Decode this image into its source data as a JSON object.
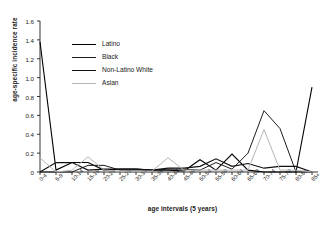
{
  "chart_data": {
    "type": "line",
    "title": "",
    "xlabel": "age intervals (5 years)",
    "ylabel": "age-specific incidence rate",
    "ylim": [
      0,
      1.6
    ],
    "ytick_step": 0.2,
    "yticks": [
      "0",
      "0.2",
      "0.4",
      "0.6",
      "0.8",
      "1.0",
      "1.2",
      "1.4",
      "1.6"
    ],
    "grid": false,
    "legend_position": "upper-center-left",
    "categories": [
      "0-4",
      "5-9",
      "10-14",
      "15-19",
      "20-24",
      "25-29",
      "30-34",
      "35-39",
      "40-44",
      "45-49",
      "50-54",
      "55-59",
      "60-64",
      "65-69",
      "70-74",
      "75-79",
      "80-84",
      "85+"
    ],
    "series": [
      {
        "name": "Latino",
        "color": "#000000",
        "width": 1.1,
        "values": [
          1.38,
          0.02,
          0.1,
          0.1,
          0.02,
          0.03,
          0.03,
          0.02,
          0.02,
          0.01,
          0.13,
          0.02,
          0.19,
          0.02,
          0.0,
          0.0,
          0.0,
          0.9
        ]
      },
      {
        "name": "Black",
        "color": "#1c1c1c",
        "width": 1.0,
        "values": [
          0.0,
          0.0,
          0.0,
          0.07,
          0.07,
          0.02,
          0.02,
          0.02,
          0.03,
          0.03,
          0.02,
          0.1,
          0.03,
          0.2,
          0.65,
          0.46,
          0.0,
          0.0
        ]
      },
      {
        "name": "Non-Latino White",
        "color": "#111111",
        "width": 1.2,
        "values": [
          0.0,
          0.1,
          0.1,
          0.02,
          0.03,
          0.03,
          0.03,
          0.02,
          0.04,
          0.04,
          0.06,
          0.14,
          0.06,
          0.09,
          0.04,
          0.06,
          0.06,
          0.0
        ]
      },
      {
        "name": "Asian",
        "color": "#b5b5b5",
        "width": 1.0,
        "values": [
          0.15,
          0.0,
          0.02,
          0.16,
          0.02,
          0.01,
          0.01,
          0.01,
          0.15,
          0.02,
          0.02,
          0.02,
          0.02,
          0.02,
          0.45,
          0.02,
          0.02,
          0.0
        ]
      }
    ]
  },
  "legend": {
    "items": [
      {
        "label": "Latino"
      },
      {
        "label": "Black"
      },
      {
        "label": "Non-Latino White"
      },
      {
        "label": "Asian"
      }
    ]
  }
}
